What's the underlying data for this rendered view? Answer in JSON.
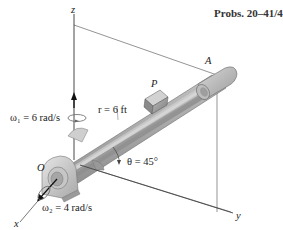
{
  "figure": {
    "title": "Probs. 20–41/42",
    "axes": {
      "x": "x",
      "y": "y",
      "z": "z"
    },
    "points": {
      "origin": "O",
      "end": "A",
      "slider": "P"
    },
    "labels": {
      "omega1": "ω₁ = 6 rad/s",
      "omega2": "ω₂ = 4 rad/s",
      "radius": "r = 6 ft",
      "theta": "θ = 45°"
    },
    "colors": {
      "rod_light": "#c8c8c8",
      "rod_mid": "#a9a9a9",
      "rod_dark": "#7d7d7d",
      "line": "#555555",
      "text": "#222222"
    }
  }
}
